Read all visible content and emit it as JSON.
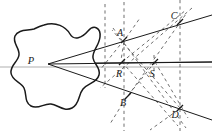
{
  "figure": {
    "type": "geometric-diagram",
    "background_color": "#ffffff",
    "stroke_color": "#1a1a1a",
    "axis_color": "#a8a8a8",
    "dash_color": "#5a5a5a"
  },
  "labels": {
    "p": "P",
    "a": "A",
    "b": "B",
    "c": "C",
    "d": "D",
    "r": "R",
    "s": "S"
  },
  "points": {
    "P": {
      "x": 48,
      "y": 64
    },
    "A": {
      "x": 124,
      "y": 40
    },
    "B": {
      "x": 128,
      "y": 96
    },
    "C": {
      "x": 180,
      "y": 22
    },
    "D": {
      "x": 180,
      "y": 108
    },
    "R": {
      "x": 122,
      "y": 62
    },
    "S": {
      "x": 155,
      "y": 62
    }
  },
  "blob": {
    "name": "closed-curve-region",
    "center": {
      "x": 55,
      "y": 66
    },
    "path": "M 44 25 C 56 21, 66 27, 70 34 C 74 41, 82 38, 88 31 C 94 24, 101 28, 100 37 C 99 46, 92 51, 93 58 C 94 65, 101 67, 99 75 C 97 83, 88 83, 83 89 C 78 95, 80 104, 72 108 C 64 112, 58 105, 51 104 C 44 103, 38 110, 31 106 C 24 102, 27 94, 24 88 C 21 82, 12 81, 11 73 C 10 65, 18 62, 19 55 C 20 48, 12 43, 15 36 C 18 29, 28 31, 34 29 C 38 27, 40 26, 44 25 Z"
  },
  "axis": {
    "name": "horizontal-axis-line",
    "y": 67,
    "x1": 0,
    "x2": 212
  }
}
